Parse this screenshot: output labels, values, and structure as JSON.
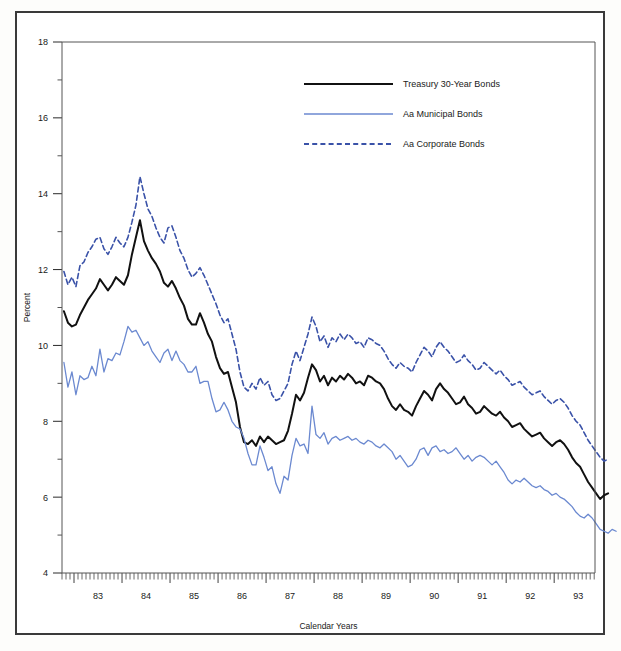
{
  "figure": {
    "background_color": "#ffffff",
    "frame_color": "#3a3a3a"
  },
  "chart_data": {
    "type": "line",
    "title": "",
    "subtitle": "",
    "xlabel": "Calendar Years",
    "ylabel": "Percent",
    "ylim": [
      4,
      18
    ],
    "xlim": [
      1982.75,
      1993.85
    ],
    "ytick_labels": [
      "4",
      "6",
      "8",
      "10",
      "12",
      "14",
      "16",
      "18"
    ],
    "yticks": [
      4,
      6,
      8,
      10,
      12,
      14,
      16,
      18
    ],
    "xtick_labels": [
      "83",
      "84",
      "85",
      "86",
      "87",
      "88",
      "89",
      "90",
      "91",
      "92",
      "93"
    ],
    "xticks": [
      1983,
      1984,
      1985,
      1986,
      1987,
      1988,
      1989,
      1990,
      1991,
      1992,
      1993
    ],
    "minor_xticks_per_year": 12,
    "grid": false,
    "legend_position": "upper-center",
    "x_start": 1982.79,
    "x_step": 0.08333,
    "series": [
      {
        "name": "Treasury 30-Year Bonds",
        "color": "#111111",
        "style": "solid",
        "width": 2.0,
        "values": [
          10.9,
          10.6,
          10.5,
          10.55,
          10.8,
          11.0,
          11.2,
          11.35,
          11.5,
          11.75,
          11.6,
          11.45,
          11.6,
          11.8,
          11.7,
          11.6,
          11.85,
          12.4,
          12.85,
          13.3,
          12.75,
          12.5,
          12.3,
          12.15,
          11.95,
          11.65,
          11.55,
          11.7,
          11.5,
          11.25,
          11.05,
          10.7,
          10.55,
          10.55,
          10.85,
          10.6,
          10.3,
          10.1,
          9.7,
          9.4,
          9.25,
          9.3,
          8.9,
          8.5,
          7.85,
          7.45,
          7.4,
          7.5,
          7.35,
          7.6,
          7.45,
          7.6,
          7.5,
          7.4,
          7.45,
          7.5,
          7.75,
          8.2,
          8.7,
          8.55,
          8.75,
          9.15,
          9.5,
          9.35,
          9.05,
          9.2,
          8.95,
          9.15,
          9.05,
          9.2,
          9.1,
          9.25,
          9.15,
          9.0,
          9.05,
          8.95,
          9.2,
          9.15,
          9.05,
          9.0,
          8.85,
          8.6,
          8.4,
          8.3,
          8.45,
          8.3,
          8.25,
          8.15,
          8.4,
          8.6,
          8.8,
          8.7,
          8.55,
          8.85,
          9.0,
          8.85,
          8.75,
          8.6,
          8.45,
          8.5,
          8.65,
          8.45,
          8.35,
          8.2,
          8.25,
          8.4,
          8.3,
          8.2,
          8.15,
          8.25,
          8.1,
          8.0,
          7.85,
          7.9,
          7.95,
          7.8,
          7.7,
          7.6,
          7.65,
          7.7,
          7.55,
          7.45,
          7.35,
          7.45,
          7.5,
          7.4,
          7.25,
          7.05,
          6.9,
          6.8,
          6.6,
          6.4,
          6.25,
          6.1,
          5.95,
          6.05,
          6.1
        ]
      },
      {
        "name": "Aa Municipal Bonds",
        "color": "#6b89d0",
        "style": "solid",
        "width": 1.3,
        "values": [
          9.55,
          8.9,
          9.3,
          8.7,
          9.2,
          9.1,
          9.15,
          9.45,
          9.2,
          9.9,
          9.3,
          9.65,
          9.6,
          9.8,
          9.75,
          10.1,
          10.5,
          10.35,
          10.4,
          10.2,
          10.0,
          10.1,
          9.85,
          9.7,
          9.55,
          9.8,
          9.9,
          9.6,
          9.85,
          9.6,
          9.5,
          9.3,
          9.3,
          9.45,
          9.0,
          9.05,
          9.05,
          8.6,
          8.25,
          8.3,
          8.5,
          8.3,
          8.0,
          7.85,
          7.8,
          7.55,
          7.15,
          6.85,
          6.85,
          7.35,
          7.05,
          6.7,
          6.8,
          6.35,
          6.1,
          6.55,
          6.45,
          7.1,
          7.55,
          7.35,
          7.4,
          7.15,
          8.4,
          7.65,
          7.55,
          7.7,
          7.4,
          7.55,
          7.6,
          7.5,
          7.55,
          7.6,
          7.5,
          7.55,
          7.45,
          7.4,
          7.5,
          7.45,
          7.35,
          7.3,
          7.4,
          7.3,
          7.2,
          7.0,
          7.1,
          6.95,
          6.8,
          6.85,
          7.0,
          7.25,
          7.3,
          7.1,
          7.3,
          7.35,
          7.2,
          7.25,
          7.15,
          7.2,
          7.3,
          7.15,
          7.0,
          7.1,
          6.95,
          7.05,
          7.1,
          7.05,
          6.95,
          6.85,
          6.95,
          6.8,
          6.65,
          6.45,
          6.35,
          6.45,
          6.4,
          6.5,
          6.4,
          6.3,
          6.25,
          6.3,
          6.2,
          6.15,
          6.05,
          6.1,
          6.0,
          5.95,
          5.85,
          5.75,
          5.6,
          5.5,
          5.45,
          5.55,
          5.45,
          5.3,
          5.15,
          5.1,
          5.05,
          5.15,
          5.1
        ]
      },
      {
        "name": "Aa Corporate Bonds",
        "color": "#3a52a8",
        "style": "dashed",
        "width": 1.6,
        "values": [
          11.95,
          11.6,
          11.8,
          11.55,
          12.1,
          12.2,
          12.45,
          12.6,
          12.8,
          12.85,
          12.55,
          12.4,
          12.6,
          12.85,
          12.7,
          12.6,
          12.85,
          13.25,
          13.7,
          14.45,
          14.0,
          13.6,
          13.4,
          13.1,
          12.85,
          12.7,
          13.1,
          13.15,
          12.85,
          12.5,
          12.3,
          12.0,
          11.8,
          11.9,
          12.05,
          11.85,
          11.6,
          11.35,
          11.1,
          10.8,
          10.6,
          10.7,
          10.3,
          9.9,
          9.3,
          8.9,
          8.8,
          9.0,
          8.85,
          9.15,
          8.95,
          9.05,
          8.7,
          8.55,
          8.6,
          8.8,
          9.0,
          9.5,
          9.85,
          9.6,
          9.95,
          10.3,
          10.75,
          10.5,
          10.1,
          10.25,
          9.95,
          10.2,
          10.1,
          10.3,
          10.15,
          10.3,
          10.2,
          10.05,
          10.1,
          9.95,
          10.2,
          10.15,
          10.05,
          10.0,
          9.85,
          9.65,
          9.5,
          9.4,
          9.55,
          9.45,
          9.4,
          9.3,
          9.55,
          9.75,
          9.95,
          9.85,
          9.7,
          9.95,
          10.1,
          9.95,
          9.85,
          9.7,
          9.55,
          9.6,
          9.75,
          9.6,
          9.5,
          9.35,
          9.4,
          9.55,
          9.45,
          9.35,
          9.25,
          9.35,
          9.2,
          9.1,
          8.95,
          9.0,
          9.05,
          8.9,
          8.8,
          8.7,
          8.75,
          8.8,
          8.65,
          8.55,
          8.45,
          8.55,
          8.6,
          8.5,
          8.35,
          8.15,
          8.0,
          7.9,
          7.7,
          7.5,
          7.35,
          7.2,
          7.05,
          6.95,
          7.0
        ]
      }
    ]
  },
  "legend": {
    "items": [
      {
        "label": "Treasury 30-Year Bonds",
        "color": "#111111",
        "style": "solid"
      },
      {
        "label": "Aa Municipal Bonds",
        "color": "#6b89d0",
        "style": "solid"
      },
      {
        "label": "Aa Corporate Bonds",
        "color": "#3a52a8",
        "style": "dashed"
      }
    ]
  }
}
